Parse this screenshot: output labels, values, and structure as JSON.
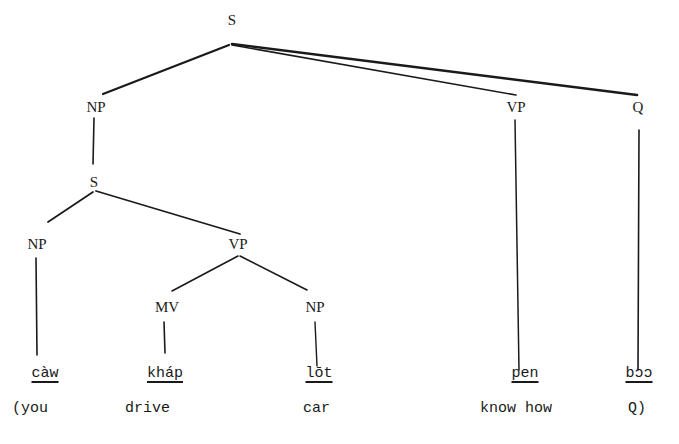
{
  "diagram": {
    "type": "syntax-tree",
    "nodes": {
      "s_root": {
        "label": "S",
        "x": 232,
        "y": 20
      },
      "np_top": {
        "label": "NP",
        "x": 96,
        "y": 107
      },
      "vp_top": {
        "label": "VP",
        "x": 516,
        "y": 107
      },
      "q": {
        "label": "Q",
        "x": 638,
        "y": 107
      },
      "s_embedded": {
        "label": "S",
        "x": 94,
        "y": 182
      },
      "np_subj": {
        "label": "NP",
        "x": 37,
        "y": 244
      },
      "vp_inner": {
        "label": "VP",
        "x": 238,
        "y": 244
      },
      "mv": {
        "label": "MV",
        "x": 167,
        "y": 307
      },
      "np_obj": {
        "label": "NP",
        "x": 315,
        "y": 307
      }
    },
    "edges": [
      {
        "from": "s_root",
        "to": "np_top",
        "x1": 229,
        "y1": 45,
        "x2": 103,
        "y2": 94,
        "w": 2.2
      },
      {
        "from": "s_root",
        "to": "vp_top",
        "x1": 232,
        "y1": 45,
        "x2": 516,
        "y2": 95,
        "w": 1.6
      },
      {
        "from": "s_root",
        "to": "q",
        "x1": 232,
        "y1": 44,
        "x2": 637,
        "y2": 95,
        "w": 2.6
      },
      {
        "from": "np_top",
        "to": "s_embedded",
        "x1": 94,
        "y1": 118,
        "x2": 93,
        "y2": 164,
        "w": 1.6
      },
      {
        "from": "s_embedded",
        "to": "np_subj",
        "x1": 93,
        "y1": 192,
        "x2": 48,
        "y2": 222,
        "w": 1.8
      },
      {
        "from": "s_embedded",
        "to": "vp_inner",
        "x1": 96,
        "y1": 191,
        "x2": 240,
        "y2": 234,
        "w": 1.8
      },
      {
        "from": "vp_inner",
        "to": "mv",
        "x1": 238,
        "y1": 256,
        "x2": 172,
        "y2": 291,
        "w": 1.6
      },
      {
        "from": "vp_inner",
        "to": "np_obj",
        "x1": 240,
        "y1": 256,
        "x2": 307,
        "y2": 290,
        "w": 1.6
      },
      {
        "from": "np_subj",
        "to": "word_caw",
        "x1": 36,
        "y1": 258,
        "x2": 37,
        "y2": 355,
        "w": 1.6
      },
      {
        "from": "mv",
        "to": "word_khap",
        "x1": 164,
        "y1": 322,
        "x2": 165,
        "y2": 353,
        "w": 1.6
      },
      {
        "from": "np_obj",
        "to": "word_lot",
        "x1": 315,
        "y1": 322,
        "x2": 317,
        "y2": 366,
        "w": 1.4
      },
      {
        "from": "vp_top",
        "to": "word_pen",
        "x1": 515,
        "y1": 120,
        "x2": 519,
        "y2": 370,
        "w": 1.5
      },
      {
        "from": "q",
        "to": "word_boo",
        "x1": 639,
        "y1": 130,
        "x2": 638,
        "y2": 370,
        "w": 1.6
      }
    ],
    "words": [
      {
        "id": "word_caw",
        "text": "càw",
        "x": 45,
        "y": 374
      },
      {
        "id": "word_khap",
        "text": "kháp",
        "x": 165,
        "y": 374
      },
      {
        "id": "word_lot",
        "text": "lōt",
        "x": 319,
        "y": 374
      },
      {
        "id": "word_pen",
        "text": "pen",
        "x": 525,
        "y": 374
      },
      {
        "id": "word_boo",
        "text": "bɔɔ",
        "x": 639,
        "y": 374
      }
    ],
    "glosses": [
      {
        "text": "(you",
        "x": 12,
        "y": 409
      },
      {
        "text": "drive",
        "x": 125,
        "y": 409
      },
      {
        "text": "car",
        "x": 303,
        "y": 409
      },
      {
        "text": "know how",
        "x": 480,
        "y": 409
      },
      {
        "text": "Q)",
        "x": 628,
        "y": 409
      }
    ],
    "line_color": "#1a1a1a"
  }
}
